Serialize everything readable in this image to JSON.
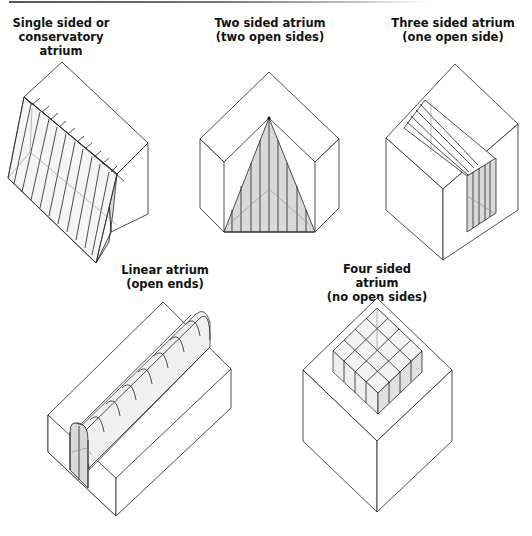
{
  "figure": {
    "rule": "top-horizontal-rule",
    "colors": {
      "line": "#222222",
      "glass_fill": "#d9d9d9",
      "glass_light": "#eeeeee",
      "background": "#ffffff"
    },
    "diagrams": [
      {
        "id": "single",
        "title_line1": "Single sided or",
        "title_line2": "conservatory atrium"
      },
      {
        "id": "two",
        "title_line1": "Two sided atrium",
        "title_line2": "(two open sides)"
      },
      {
        "id": "three",
        "title_line1": "Three sided atrium",
        "title_line2": "(one open side)"
      },
      {
        "id": "linear",
        "title_line1": "Linear atrium",
        "title_line2": "(open ends)"
      },
      {
        "id": "four",
        "title_line1": "Four sided atrium",
        "title_line2": "(no open sides)"
      }
    ]
  }
}
